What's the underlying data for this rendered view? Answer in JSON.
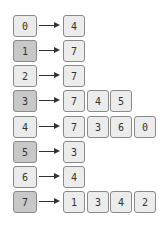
{
  "diagram": {
    "type": "adjacency-list",
    "rows": [
      {
        "index": "0",
        "shade": "light",
        "values": [
          "4"
        ]
      },
      {
        "index": "1",
        "shade": "dark",
        "values": [
          "7"
        ]
      },
      {
        "index": "2",
        "shade": "light",
        "values": [
          "7"
        ]
      },
      {
        "index": "3",
        "shade": "dark",
        "values": [
          "7",
          "4",
          "5"
        ]
      },
      {
        "index": "4",
        "shade": "light",
        "values": [
          "7",
          "3",
          "6",
          "0"
        ]
      },
      {
        "index": "5",
        "shade": "dark",
        "values": [
          "3"
        ]
      },
      {
        "index": "6",
        "shade": "light",
        "values": [
          "4"
        ]
      },
      {
        "index": "7",
        "shade": "dark",
        "values": [
          "1",
          "3",
          "4",
          "2"
        ]
      }
    ],
    "colors": {
      "light_box": "#ebebeb",
      "dark_box": "#c8c8c8",
      "border": "#8a8a8a",
      "arrow": "#333333"
    }
  }
}
